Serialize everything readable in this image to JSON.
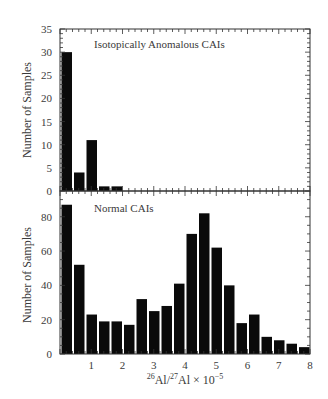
{
  "chart_data": [
    {
      "type": "bar",
      "panel": "top",
      "title": "Isotopically Anomalous CAIs",
      "xlabel": "",
      "ylabel": "Number of Samples",
      "bin_width": 0.4,
      "x_bin_starts": [
        0.0,
        0.4,
        0.8,
        1.2,
        1.6
      ],
      "values": [
        30,
        4,
        11,
        1,
        1
      ],
      "xlim": [
        0,
        8
      ],
      "ylim": [
        0,
        35
      ],
      "yticks": [
        0,
        5,
        10,
        15,
        20,
        25,
        30,
        35
      ],
      "xticks": [],
      "grid": false
    },
    {
      "type": "bar",
      "panel": "bottom",
      "title": "Normal CAIs",
      "xlabel": "26Al/27Al × 10^-5",
      "ylabel": "Number of Samples",
      "bin_width": 0.4,
      "x_bin_starts": [
        0.0,
        0.4,
        0.8,
        1.2,
        1.6,
        2.0,
        2.4,
        2.8,
        3.2,
        3.6,
        4.0,
        4.4,
        4.8,
        5.2,
        5.6,
        6.0,
        6.4,
        6.8,
        7.2,
        7.6
      ],
      "values": [
        87,
        52,
        23,
        19,
        19,
        17,
        32,
        25,
        28,
        41,
        70,
        82,
        62,
        40,
        18,
        23,
        10,
        8,
        6,
        4
      ],
      "xlim": [
        0,
        8
      ],
      "ylim": [
        0,
        95
      ],
      "yticks": [
        0,
        20,
        40,
        60,
        80
      ],
      "xticks": [
        1,
        2,
        3,
        4,
        5,
        6,
        7,
        8
      ],
      "grid": false
    }
  ],
  "labels": {
    "top_panel": "Isotopically Anomalous CAIs",
    "bottom_panel": "Normal CAIs",
    "ylabel_top": "Number of Samples",
    "ylabel_bottom": "Number of Samples",
    "xlabel_sup1": "26",
    "xlabel_al1": "Al/",
    "xlabel_sup2": "27",
    "xlabel_al2": "Al × 10",
    "xlabel_exp": "−5"
  },
  "colors": {
    "bar": "#0a0a0a",
    "axis": "#333333"
  }
}
